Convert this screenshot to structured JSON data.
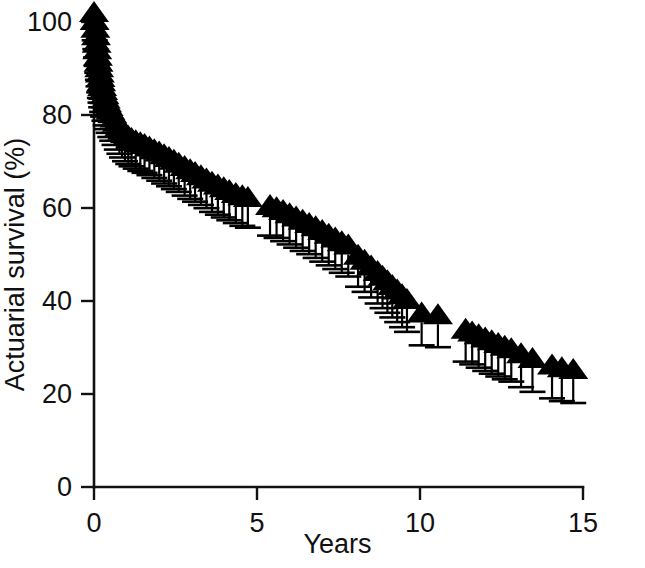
{
  "figure": {
    "background_color": "#ffffff",
    "ink_color": "#000000"
  },
  "chart_data": {
    "type": "scatter",
    "title": "",
    "subtitle": "",
    "xlabel": "Years",
    "ylabel": "Actuarial survival (%)",
    "xlim": [
      0,
      15
    ],
    "ylim": [
      0,
      100
    ],
    "xticks": [
      0,
      5,
      10,
      15
    ],
    "xtick_labels": [
      "0",
      "5",
      "10",
      "15"
    ],
    "yticks": [
      0,
      20,
      40,
      60,
      80,
      100
    ],
    "ytick_labels": [
      "0",
      "20",
      "40",
      "60",
      "80",
      "100"
    ],
    "grid": false,
    "legend": null,
    "legend_position": "none",
    "marker_shape": "filled-triangle-up",
    "marker_color": "#000000",
    "error_bars": "lower-only-vertical-with-cap",
    "annotations": [],
    "series": [
      {
        "name": "Actuarial survival",
        "x": [
          0.0,
          0.02,
          0.04,
          0.06,
          0.08,
          0.1,
          0.12,
          0.14,
          0.16,
          0.18,
          0.2,
          0.22,
          0.25,
          0.28,
          0.32,
          0.36,
          0.4,
          0.45,
          0.5,
          0.56,
          0.63,
          0.7,
          0.78,
          0.86,
          0.95,
          1.05,
          1.15,
          1.28,
          1.42,
          1.55,
          1.7,
          1.85,
          2.0,
          2.15,
          2.3,
          2.45,
          2.6,
          2.78,
          2.95,
          3.1,
          3.28,
          3.45,
          3.62,
          3.8,
          3.98,
          4.15,
          4.35,
          4.55,
          4.72,
          5.4,
          5.6,
          5.8,
          6.0,
          6.2,
          6.4,
          6.6,
          6.8,
          7.0,
          7.2,
          7.4,
          7.6,
          7.8,
          8.1,
          8.3,
          8.5,
          8.7,
          8.85,
          9.0,
          9.15,
          9.3,
          9.45,
          9.6,
          10.05,
          10.55,
          11.4,
          11.6,
          11.8,
          12.0,
          12.2,
          12.4,
          12.6,
          12.8,
          13.1,
          13.45,
          14.05,
          14.35,
          14.7
        ],
        "values": [
          100.0,
          98.3,
          96.6,
          95.0,
          93.4,
          92.0,
          90.6,
          89.3,
          88.1,
          87.0,
          86.0,
          85.1,
          84.1,
          83.2,
          82.3,
          81.4,
          80.6,
          79.8,
          79.0,
          78.2,
          77.3,
          76.4,
          75.5,
          74.7,
          74.0,
          73.4,
          72.9,
          72.4,
          72.0,
          71.6,
          71.1,
          70.5,
          70.0,
          69.4,
          68.8,
          68.2,
          67.6,
          66.9,
          66.2,
          65.6,
          64.9,
          64.2,
          63.5,
          62.9,
          62.3,
          61.7,
          61.1,
          60.6,
          60.2,
          58.5,
          58.0,
          57.4,
          56.7,
          56.0,
          55.3,
          54.6,
          53.9,
          53.1,
          52.3,
          51.5,
          50.7,
          50.0,
          47.8,
          46.7,
          45.5,
          44.3,
          43.3,
          42.3,
          41.3,
          40.3,
          39.3,
          38.3,
          35.4,
          35.0,
          31.9,
          31.3,
          30.7,
          30.0,
          29.4,
          28.8,
          28.2,
          27.7,
          26.6,
          25.6,
          24.2,
          23.6,
          23.2
        ],
        "lower_error": [
          0.0,
          0.3,
          0.5,
          0.7,
          0.9,
          1.0,
          1.1,
          1.2,
          1.3,
          1.4,
          1.4,
          1.5,
          1.5,
          1.6,
          1.6,
          1.7,
          1.7,
          1.7,
          1.8,
          1.8,
          1.8,
          1.9,
          1.9,
          1.9,
          2.0,
          2.0,
          2.0,
          2.0,
          2.1,
          2.1,
          2.1,
          2.1,
          2.2,
          2.2,
          2.2,
          2.2,
          2.2,
          2.3,
          2.3,
          2.3,
          2.3,
          2.3,
          2.4,
          2.4,
          2.4,
          2.4,
          2.4,
          2.5,
          2.5,
          2.5,
          2.5,
          2.6,
          2.6,
          2.6,
          2.6,
          2.6,
          2.7,
          2.7,
          2.7,
          2.7,
          2.7,
          2.8,
          2.8,
          2.8,
          2.8,
          2.9,
          2.9,
          2.9,
          2.9,
          2.9,
          3.0,
          3.0,
          3.0,
          3.0,
          3.0,
          3.0,
          3.1,
          3.1,
          3.1,
          3.1,
          3.1,
          3.1,
          3.2,
          3.2,
          3.2,
          3.2,
          3.2
        ]
      }
    ]
  }
}
